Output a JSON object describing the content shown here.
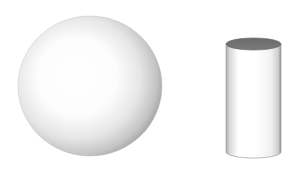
{
  "scene": {
    "description": "3D rendered sphere and cylinder on white background",
    "background": "#ffffff",
    "objects": [
      {
        "name": "sphere",
        "shape": "sphere",
        "center": [
          90,
          86
        ],
        "radius_x": 72,
        "radius_y": 70,
        "highlight_color": "#ffffff",
        "shadow_color": "#9a9a9a"
      },
      {
        "name": "cylinder",
        "shape": "cylinder",
        "left": 226,
        "right": 281,
        "top": 44,
        "bottom": 158,
        "top_cap_color": "#6f6f6f",
        "body_highlight": "#ffffff",
        "body_shadow": "#8c8c8c"
      }
    ]
  }
}
